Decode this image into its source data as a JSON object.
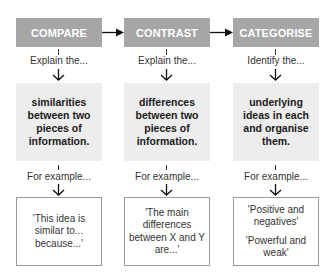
{
  "columns": [
    {
      "header": "COMPARE",
      "prompt": "Explain the...",
      "focus": "similarities between two pieces of information.",
      "example_label": "For example...",
      "examples": [
        "'This idea is similar to... because...'"
      ]
    },
    {
      "header": "CONTRAST",
      "prompt": "Explain the...",
      "focus": "differences between two pieces of information.",
      "example_label": "For example...",
      "examples": [
        "'The main differences between X and Y are...'"
      ]
    },
    {
      "header": "CATEGORISE",
      "prompt": "Identify the...",
      "focus": "underlying ideas in each and organise them.",
      "example_label": "For example...",
      "examples": [
        "'Positive and negatives'",
        "'Powerful and weak'"
      ]
    }
  ],
  "colors": {
    "header_bg": "#a6a6a6",
    "focus_bg": "#ededed",
    "border": "#9a9a9a"
  }
}
